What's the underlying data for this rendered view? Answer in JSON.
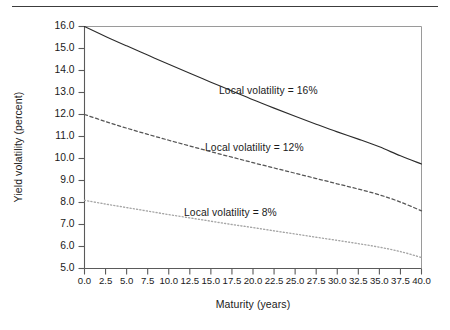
{
  "figure": {
    "has_top_rule": true,
    "background": "#ffffff",
    "ink_color": "#1a1a1a"
  },
  "chart_data": {
    "type": "line",
    "title": "",
    "xlabel": "Maturity (years)",
    "ylabel": "Yield volatility (percent)",
    "xlim": [
      0.0,
      40.0
    ],
    "ylim": [
      5.0,
      16.0
    ],
    "grid": false,
    "legend_position": "inline-annotations",
    "xticks": [
      0.0,
      2.5,
      5.0,
      7.5,
      10.0,
      12.5,
      15.0,
      17.5,
      20.0,
      22.5,
      25.0,
      27.5,
      30.0,
      32.5,
      35.0,
      37.5,
      40.0
    ],
    "xtick_labels": [
      "0.0",
      "2.5",
      "5.0",
      "7.5",
      "10.0",
      "12.5",
      "15.0",
      "17.5",
      "20.0",
      "22.5",
      "25.0",
      "27.5",
      "30.0",
      "32.5",
      "35.0",
      "37.5",
      "40.0"
    ],
    "yticks": [
      5.0,
      6.0,
      7.0,
      8.0,
      9.0,
      10.0,
      11.0,
      12.0,
      13.0,
      14.0,
      15.0,
      16.0
    ],
    "ytick_labels": [
      "5.0",
      "6.0",
      "7.0",
      "8.0",
      "9.0",
      "10.0",
      "11.0",
      "12.0",
      "13.0",
      "14.0",
      "15.0",
      "16.0"
    ],
    "x": [
      0.0,
      2.5,
      5.0,
      7.5,
      10.0,
      12.5,
      15.0,
      17.5,
      20.0,
      22.5,
      25.0,
      27.5,
      30.0,
      32.5,
      35.0,
      37.5,
      40.0
    ],
    "series": [
      {
        "name": "Local volatility = 16%",
        "style": "solid",
        "color": "#2b2b2b",
        "values": [
          16.0,
          15.55,
          15.12,
          14.7,
          14.28,
          13.87,
          13.47,
          13.07,
          12.67,
          12.29,
          11.92,
          11.56,
          11.21,
          10.88,
          10.53,
          10.12,
          9.75
        ]
      },
      {
        "name": "Local volatility = 12%",
        "style": "dashed",
        "color": "#555555",
        "values": [
          12.0,
          11.68,
          11.38,
          11.1,
          10.83,
          10.57,
          10.31,
          10.06,
          9.81,
          9.57,
          9.33,
          9.09,
          8.85,
          8.61,
          8.35,
          8.02,
          7.62
        ]
      },
      {
        "name": "Local volatility = 8%",
        "style": "dotted",
        "color": "#a6a6a6",
        "values": [
          8.1,
          7.93,
          7.77,
          7.61,
          7.45,
          7.3,
          7.15,
          7.0,
          6.86,
          6.71,
          6.57,
          6.42,
          6.28,
          6.13,
          5.97,
          5.77,
          5.5
        ]
      }
    ],
    "annotations": [
      {
        "text": "Local volatility = 16%",
        "x_px": 219,
        "y_px": 85
      },
      {
        "text": "Local volatility = 12%",
        "x_px": 205,
        "y_px": 142
      },
      {
        "text": "Local volatility = 8%",
        "x_px": 184,
        "y_px": 207
      }
    ]
  }
}
